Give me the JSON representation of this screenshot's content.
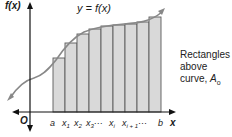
{
  "diagram": {
    "curve_label": "y = f(x)",
    "y_axis_label": "f(x)",
    "x_axis_label": "x",
    "origin_label": "O",
    "x_ticks": [
      "a",
      "x1",
      "x2",
      "x3",
      "···",
      "xi",
      "xi+1",
      "···",
      "b"
    ],
    "side_text": {
      "line1": "Rectangles",
      "line2": "above",
      "line3_prefix": "curve, ",
      "line3_symbol": "A",
      "line3_sub": "o"
    },
    "colors": {
      "rect_fill": "#d9d9d9",
      "rect_stroke": "#5a5a5a",
      "curve": "#888888",
      "axis": "#111111"
    },
    "rectangles": {
      "count": 9,
      "x_edges": [
        53,
        65,
        77,
        89,
        101,
        113,
        125,
        137,
        149,
        161
      ],
      "tops": [
        58,
        43,
        34,
        29,
        26,
        25,
        24,
        22,
        17
      ]
    }
  }
}
